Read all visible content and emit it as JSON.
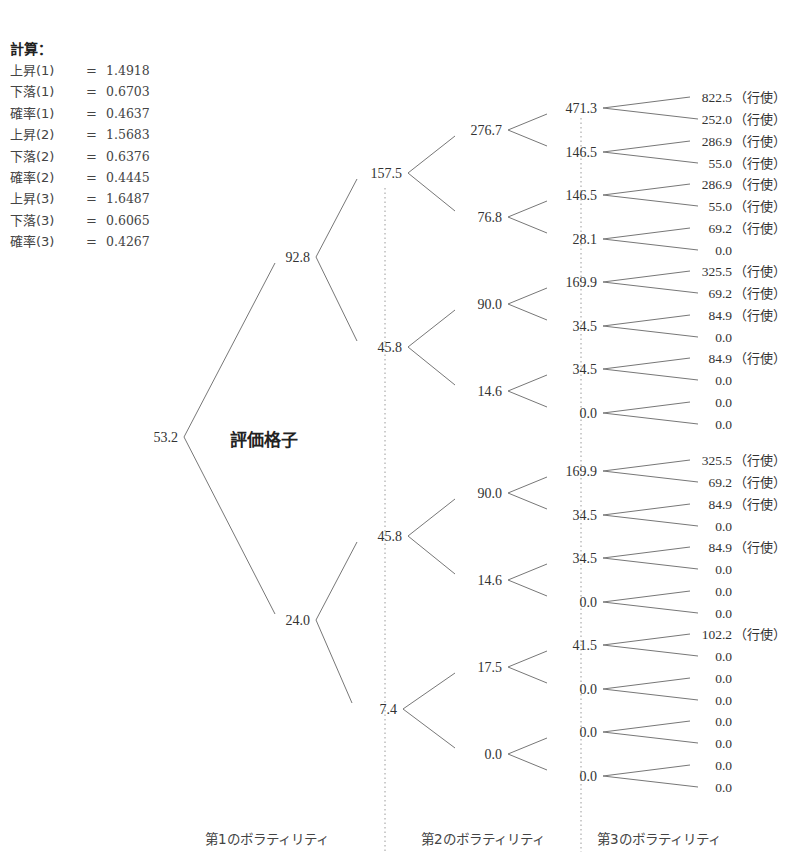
{
  "calculation": {
    "title": "計算：",
    "rows": [
      {
        "label": "上昇(1)",
        "eq": "=",
        "value": "1.4918"
      },
      {
        "label": "下落(1)",
        "eq": "=",
        "value": "0.6703"
      },
      {
        "label": "確率(1)",
        "eq": "=",
        "value": "0.4637"
      },
      {
        "label": "上昇(2)",
        "eq": "=",
        "value": "1.5683"
      },
      {
        "label": "下落(2)",
        "eq": "=",
        "value": "0.6376"
      },
      {
        "label": "確率(2)",
        "eq": "=",
        "value": "0.4445"
      },
      {
        "label": "上昇(3)",
        "eq": "=",
        "value": "1.6487"
      },
      {
        "label": "下落(3)",
        "eq": "=",
        "value": "0.6065"
      },
      {
        "label": "確率(3)",
        "eq": "=",
        "value": "0.4267"
      }
    ]
  },
  "lattice_label": "評価格子",
  "exercise_note": "（行使）",
  "tree": {
    "root": "53.2",
    "level1": [
      "92.8",
      "24.0"
    ],
    "level2": [
      "157.5",
      "45.8",
      "45.8",
      "7.4"
    ],
    "level3": [
      "276.7",
      "76.8",
      "90.0",
      "14.6",
      "90.0",
      "14.6",
      "17.5",
      "0.0"
    ],
    "level4": [
      "471.3",
      "146.5",
      "146.5",
      "28.1",
      "169.9",
      "34.5",
      "34.5",
      "0.0",
      "169.9",
      "34.5",
      "34.5",
      "0.0",
      "41.5",
      "0.0",
      "0.0",
      "0.0"
    ],
    "leaves": [
      {
        "value": "822.5",
        "exercise": true
      },
      {
        "value": "252.0",
        "exercise": true
      },
      {
        "value": "286.9",
        "exercise": true
      },
      {
        "value": "55.0",
        "exercise": true
      },
      {
        "value": "286.9",
        "exercise": true
      },
      {
        "value": "55.0",
        "exercise": true
      },
      {
        "value": "69.2",
        "exercise": true
      },
      {
        "value": "0.0",
        "exercise": false
      },
      {
        "value": "325.5",
        "exercise": true
      },
      {
        "value": "69.2",
        "exercise": true
      },
      {
        "value": "84.9",
        "exercise": true
      },
      {
        "value": "0.0",
        "exercise": false
      },
      {
        "value": "84.9",
        "exercise": true
      },
      {
        "value": "0.0",
        "exercise": false
      },
      {
        "value": "0.0",
        "exercise": false
      },
      {
        "value": "0.0",
        "exercise": false
      },
      {
        "value": "325.5",
        "exercise": true
      },
      {
        "value": "69.2",
        "exercise": true
      },
      {
        "value": "84.9",
        "exercise": true
      },
      {
        "value": "0.0",
        "exercise": false
      },
      {
        "value": "84.9",
        "exercise": true
      },
      {
        "value": "0.0",
        "exercise": false
      },
      {
        "value": "0.0",
        "exercise": false
      },
      {
        "value": "0.0",
        "exercise": false
      },
      {
        "value": "102.2",
        "exercise": true
      },
      {
        "value": "0.0",
        "exercise": false
      },
      {
        "value": "0.0",
        "exercise": false
      },
      {
        "value": "0.0",
        "exercise": false
      },
      {
        "value": "0.0",
        "exercise": false
      },
      {
        "value": "0.0",
        "exercise": false
      },
      {
        "value": "0.0",
        "exercise": false
      },
      {
        "value": "0.0",
        "exercise": false
      }
    ]
  },
  "volatility_labels": [
    "第1のボラティリティ",
    "第2のボラティリティ",
    "第3のボラティリティ"
  ]
}
